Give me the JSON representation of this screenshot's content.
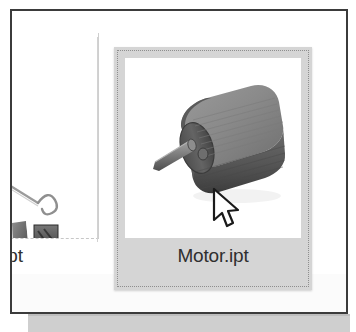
{
  "window": {
    "frame_border_color": "#3b3b3b",
    "background_color": "#ffffff"
  },
  "file_browser": {
    "view": "thumbnails",
    "items": [
      {
        "name": "Rod.ipt",
        "selected": false,
        "thumbnail": "rod-part-thumbnail",
        "position": "left-partially-offscreen"
      },
      {
        "name": "Motor.ipt",
        "selected": true,
        "thumbnail": "motor-part-thumbnail",
        "position": "center",
        "selection_background": "#d5d5d5",
        "focus_border": "dotted"
      }
    ],
    "partial_thumbnails": [
      {
        "name": "clamp-thumbnail-left"
      },
      {
        "name": "clamp-thumbnail-right"
      }
    ]
  },
  "cursor": {
    "type": "arrow-pointer",
    "x": 199,
    "y": 176,
    "over_item": "Motor.ipt"
  },
  "colors": {
    "selection_gray": "#d5d5d5",
    "frame_dark": "#3b3b3b",
    "text": "#2f2f2f",
    "separator": "#d2d2d2",
    "shadow_band": "#cfcfcf"
  }
}
